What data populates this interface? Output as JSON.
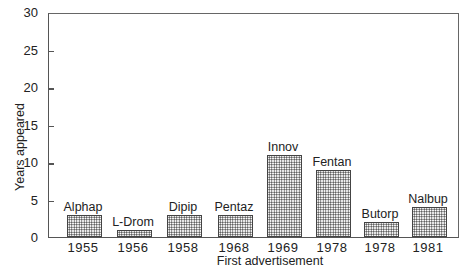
{
  "chart_data": {
    "type": "bar",
    "title": "",
    "xlabel": "First advertisement",
    "ylabel": "Years appeared",
    "ylim": [
      0,
      30
    ],
    "yticks": [
      0,
      5,
      10,
      15,
      20,
      25,
      30
    ],
    "grid": false,
    "legend": null,
    "categories": [
      "1955",
      "1956",
      "1958",
      "1968",
      "1969",
      "1978",
      "1978",
      "1981"
    ],
    "bar_labels": [
      "Alphap",
      "L-Drom",
      "Dipip",
      "Pentaz",
      "Innov",
      "Fentan",
      "Butorp",
      "Nalbup"
    ],
    "values": [
      3,
      1,
      3,
      3,
      11,
      9,
      2,
      4
    ]
  },
  "axis": {
    "ytick_labels": [
      "0",
      "5",
      "10",
      "15",
      "20",
      "25",
      "30"
    ]
  }
}
